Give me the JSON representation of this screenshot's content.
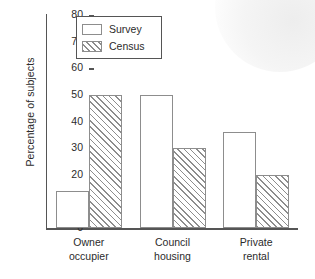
{
  "chart_data": {
    "type": "bar",
    "title": "",
    "xlabel": "",
    "ylabel": "Percentage of subjects",
    "ylim": [
      0,
      80
    ],
    "yticks": [
      0,
      10,
      20,
      30,
      40,
      50,
      60,
      70,
      80
    ],
    "ytick_labels": [
      "0",
      "10",
      "20",
      "30",
      "40",
      "50",
      "60",
      "70",
      "80"
    ],
    "grid": false,
    "legend_position": "upper left (inside axes)",
    "categories": [
      "Owner\noccupier",
      "Council\nhousing",
      "Private\nrental"
    ],
    "category_labels_flat": [
      "Owner occupier",
      "Council housing",
      "Private rental"
    ],
    "series": [
      {
        "name": "Survey",
        "fill": "none",
        "values": [
          14,
          50,
          36
        ]
      },
      {
        "name": "Census",
        "fill": "diagonal-hatch",
        "values": [
          50,
          30,
          20
        ]
      }
    ]
  },
  "legend": {
    "entries": [
      {
        "label": "Survey",
        "swatch": "empty-box-swatch"
      },
      {
        "label": "Census",
        "swatch": "hatched-box-swatch"
      }
    ]
  },
  "colors": {
    "axis": "#555555",
    "bar_outline": "#8d8d8d",
    "bar_fill_survey": "#ffffff",
    "hatch": "#8d8d8d",
    "background": "#ffffff",
    "text": "#2b2b2b"
  }
}
